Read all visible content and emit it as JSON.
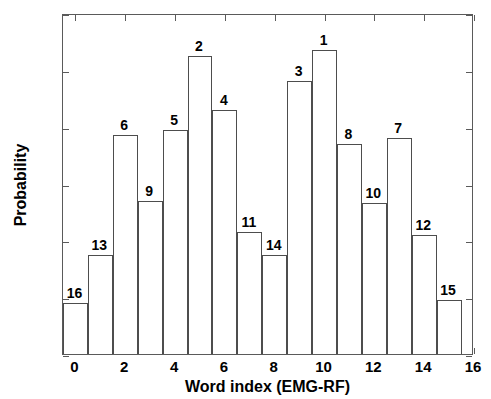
{
  "chart_data": {
    "type": "bar",
    "title": "",
    "xlabel": "Word index (EMG-RF)",
    "ylabel": "Probability",
    "xlim": [
      -0.5,
      16
    ],
    "ylim": [
      0,
      0.12
    ],
    "grid": false,
    "legend": null,
    "x_ticks": [
      "0",
      "2",
      "4",
      "6",
      "8",
      "10",
      "12",
      "14",
      "16"
    ],
    "x_tick_values": [
      0,
      2,
      4,
      6,
      8,
      10,
      12,
      14,
      16
    ],
    "y_ticks": [
      "0",
      "0.02",
      "0.04",
      "0.06",
      "0.08",
      "0.1",
      "0.12"
    ],
    "y_tick_values": [
      0,
      0.02,
      0.04,
      0.06,
      0.08,
      0.1,
      0.12
    ],
    "categories": [
      0,
      1,
      2,
      3,
      4,
      5,
      6,
      7,
      8,
      9,
      10,
      11,
      12,
      13,
      14,
      15
    ],
    "values": [
      0.018,
      0.035,
      0.077,
      0.054,
      0.079,
      0.105,
      0.086,
      0.043,
      0.035,
      0.096,
      0.107,
      0.074,
      0.053,
      0.076,
      0.042,
      0.019
    ],
    "bar_annotations": [
      "16",
      "13",
      "6",
      "9",
      "5",
      "2",
      "4",
      "11",
      "14",
      "3",
      "1",
      "8",
      "10",
      "7",
      "12",
      "15"
    ],
    "bar_edge_color": "#4d4d4d",
    "bar_fill_color": "#ffffff",
    "axis_color": "#5a5a5a"
  }
}
